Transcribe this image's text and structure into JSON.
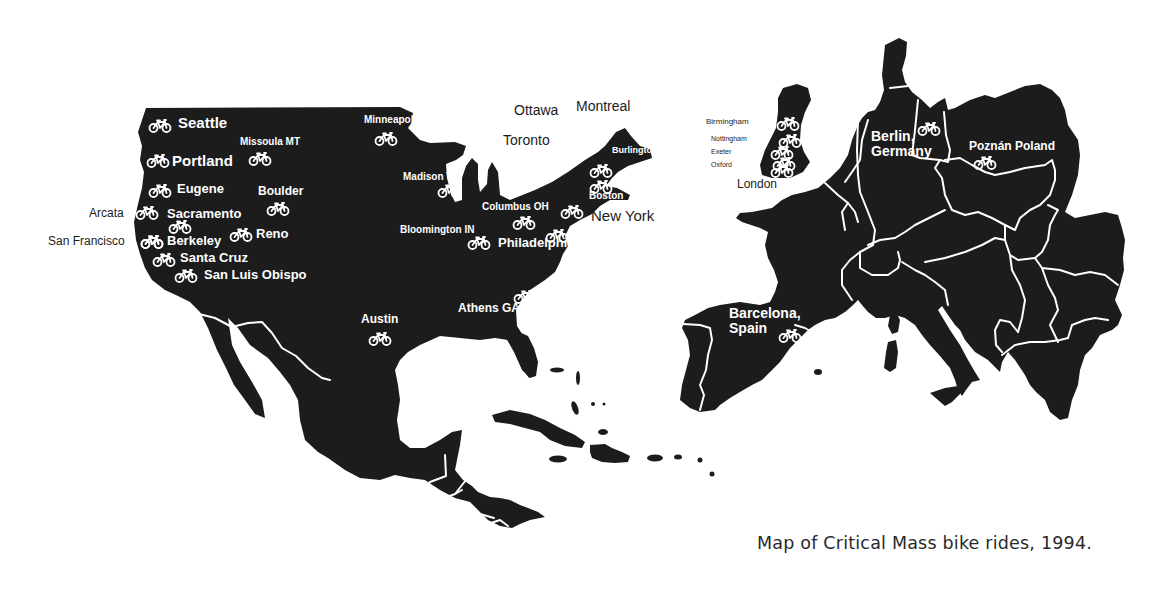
{
  "caption": "Map of Critical Mass bike rides, 1994.",
  "colors": {
    "land": "#1c1c1c",
    "label_on_land": "#ffffff",
    "label_on_sea": "#1c1c1c",
    "background": "#ffffff"
  },
  "icon": "bicycle-icon",
  "regions": {
    "north_america": {
      "cities": [
        {
          "name": "Seattle",
          "label_x": 178,
          "label_y": 115,
          "size": 15,
          "icon_x": 148,
          "icon_y": 119,
          "on_land": true
        },
        {
          "name": "Missoula MT",
          "label_x": 240,
          "label_y": 137,
          "size": 10,
          "icon_x": 248,
          "icon_y": 152,
          "on_land": true
        },
        {
          "name": "Portland",
          "label_x": 172,
          "label_y": 153,
          "size": 15,
          "icon_x": 146,
          "icon_y": 154,
          "on_land": true
        },
        {
          "name": "Eugene",
          "label_x": 177,
          "label_y": 182,
          "size": 13,
          "icon_x": 148,
          "icon_y": 184,
          "on_land": true
        },
        {
          "name": "Boulder",
          "label_x": 258,
          "label_y": 185,
          "size": 12,
          "icon_x": 266,
          "icon_y": 202,
          "on_land": true
        },
        {
          "name": "Arcata",
          "label_x": 89,
          "label_y": 207,
          "size": 12,
          "icon_x": 135,
          "icon_y": 206,
          "on_land": false
        },
        {
          "name": "Sacramento",
          "label_x": 167,
          "label_y": 207,
          "size": 13,
          "icon_x": 168,
          "icon_y": 220,
          "on_land": true
        },
        {
          "name": "Reno",
          "label_x": 256,
          "label_y": 227,
          "size": 13,
          "icon_x": 229,
          "icon_y": 228,
          "on_land": true
        },
        {
          "name": "San Francisco",
          "label_x": 48,
          "label_y": 235,
          "size": 12,
          "icon_x": 140,
          "icon_y": 235,
          "on_land": false
        },
        {
          "name": "Berkeley",
          "label_x": 167,
          "label_y": 234,
          "size": 13,
          "icon_x": 140,
          "icon_y": 235,
          "on_land": true
        },
        {
          "name": "Santa Cruz",
          "label_x": 180,
          "label_y": 251,
          "size": 13,
          "icon_x": 152,
          "icon_y": 253,
          "on_land": true
        },
        {
          "name": "San Luis Obispo",
          "label_x": 204,
          "label_y": 268,
          "size": 13,
          "icon_x": 174,
          "icon_y": 269,
          "on_land": true
        },
        {
          "name": "Minneapolis",
          "label_x": 364,
          "label_y": 115,
          "size": 10,
          "icon_x": 374,
          "icon_y": 132,
          "on_land": true
        },
        {
          "name": "Madison WI",
          "label_x": 403,
          "label_y": 172,
          "size": 10,
          "icon_x": 437,
          "icon_y": 184,
          "on_land": true
        },
        {
          "name": "Ottawa",
          "label_x": 514,
          "label_y": 103,
          "size": 14,
          "icon_x": 541,
          "icon_y": 121,
          "on_land": false
        },
        {
          "name": "Montreal",
          "label_x": 576,
          "label_y": 99,
          "size": 14,
          "icon_x": 583,
          "icon_y": 117,
          "on_land": false
        },
        {
          "name": "Toronto",
          "label_x": 503,
          "label_y": 133,
          "size": 14,
          "icon_x": 532,
          "icon_y": 150,
          "on_land": false
        },
        {
          "name": "Burlington, VT",
          "label_x": 612,
          "label_y": 146,
          "size": 9,
          "icon_x": 589,
          "icon_y": 164,
          "on_land": true
        },
        {
          "name": "Boston",
          "label_x": 589,
          "label_y": 191,
          "size": 10,
          "icon_x": 589,
          "icon_y": 180,
          "on_land": true
        },
        {
          "name": "Columbus OH",
          "label_x": 482,
          "label_y": 202,
          "size": 10,
          "icon_x": 512,
          "icon_y": 216,
          "on_land": true
        },
        {
          "name": "New York",
          "label_x": 591,
          "label_y": 208,
          "size": 15,
          "icon_x": 560,
          "icon_y": 205,
          "on_land": false
        },
        {
          "name": "Bloomington IN",
          "label_x": 400,
          "label_y": 225,
          "size": 10,
          "icon_x": 467,
          "icon_y": 236,
          "on_land": true
        },
        {
          "name": "Philadelphia",
          "label_x": 498,
          "label_y": 236,
          "size": 13,
          "icon_x": 545,
          "icon_y": 229,
          "on_land": true
        },
        {
          "name": "Athens GA",
          "label_x": 458,
          "label_y": 302,
          "size": 12,
          "icon_x": 513,
          "icon_y": 290,
          "on_land": true
        },
        {
          "name": "Austin",
          "label_x": 361,
          "label_y": 313,
          "size": 12,
          "icon_x": 368,
          "icon_y": 332,
          "on_land": true
        }
      ]
    },
    "europe": {
      "cities": [
        {
          "name": "Birmingham",
          "label_x": 706,
          "label_y": 118,
          "size": 8,
          "icon_x": 776,
          "icon_y": 117,
          "on_land": false
        },
        {
          "name": "Nottingham",
          "label_x": 711,
          "label_y": 135,
          "size": 7,
          "icon_x": 778,
          "icon_y": 134,
          "on_land": false
        },
        {
          "name": "Exeter",
          "label_x": 711,
          "label_y": 148,
          "size": 7,
          "icon_x": 770,
          "icon_y": 146,
          "on_land": false
        },
        {
          "name": "Oxford",
          "label_x": 711,
          "label_y": 161,
          "size": 7,
          "icon_x": 772,
          "icon_y": 157,
          "on_land": false
        },
        {
          "name": "London",
          "label_x": 737,
          "label_y": 178,
          "size": 12,
          "icon_x": 770,
          "icon_y": 164,
          "on_land": false
        },
        {
          "name": "Berlin, Germany",
          "label_x": 871,
          "label_y": 129,
          "size": 14,
          "icon_x": 917,
          "icon_y": 122,
          "on_land": true,
          "two_line": true
        },
        {
          "name": "Poznán Poland",
          "label_x": 969,
          "label_y": 140,
          "size": 12,
          "icon_x": 973,
          "icon_y": 156,
          "on_land": true
        },
        {
          "name": "Barcelona, Spain",
          "label_x": 729,
          "label_y": 306,
          "size": 14,
          "icon_x": 778,
          "icon_y": 329,
          "on_land": true,
          "two_line": true
        }
      ]
    }
  }
}
